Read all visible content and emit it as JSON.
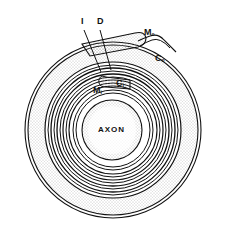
{
  "diagram": {
    "labels": {
      "axon": "AXON",
      "intraperiod": "I",
      "dense": "D",
      "outer_mesaxon": "M",
      "outer_mesaxon_sub": "o",
      "outer_cytoplasm": "C",
      "outer_cytoplasm_sub": "o",
      "inner_cytoplasm": "C",
      "inner_cytoplasm_sub": "i",
      "inner_mesaxon": "M",
      "inner_mesaxon_sub": "i"
    },
    "colors": {
      "line": "#111111",
      "stipple": "#9a9a9a",
      "background": "#ffffff"
    }
  }
}
